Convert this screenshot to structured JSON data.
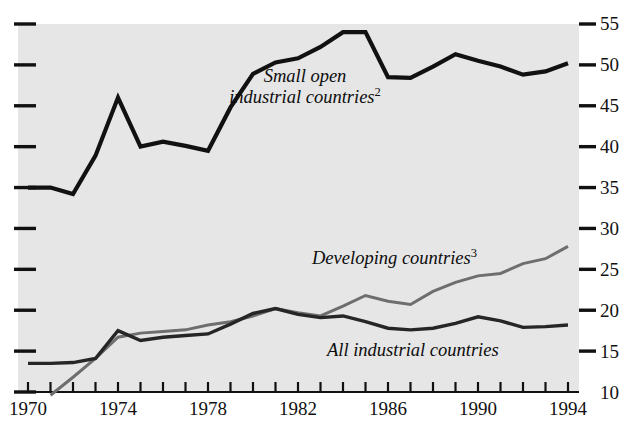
{
  "chart_data": {
    "type": "line",
    "title": "",
    "subtitle": "",
    "xlabel": "",
    "ylabel": "",
    "xlim": [
      1970,
      1994
    ],
    "ylim": [
      10,
      55
    ],
    "grid": false,
    "legend_position": "inline-annotations",
    "plot_background": "#e6e6e6",
    "x": [
      1970,
      1971,
      1972,
      1973,
      1974,
      1975,
      1976,
      1977,
      1978,
      1979,
      1980,
      1981,
      1982,
      1983,
      1984,
      1985,
      1986,
      1987,
      1988,
      1989,
      1990,
      1991,
      1992,
      1993,
      1994
    ],
    "xticks": [
      1970,
      1971,
      1972,
      1973,
      1974,
      1975,
      1976,
      1977,
      1978,
      1979,
      1980,
      1981,
      1982,
      1983,
      1984,
      1985,
      1986,
      1987,
      1988,
      1989,
      1990,
      1991,
      1992,
      1993,
      1994
    ],
    "xtick_labels": [
      "1970",
      "1974",
      "1978",
      "1982",
      "1986",
      "1990",
      "1994"
    ],
    "xtick_label_values": [
      1970,
      1974,
      1978,
      1982,
      1986,
      1990,
      1994
    ],
    "yticks": [
      10,
      15,
      20,
      25,
      30,
      35,
      40,
      45,
      50,
      55
    ],
    "ytick_labels": [
      "10",
      "15",
      "20",
      "25",
      "30",
      "35",
      "40",
      "45",
      "50",
      "55"
    ],
    "series": [
      {
        "name": "Small open industrial countries",
        "footnote": "2",
        "color": "#111111",
        "width": 4.2,
        "values": [
          35.0,
          35.0,
          34.2,
          38.9,
          46.0,
          40.0,
          40.6,
          40.1,
          39.5,
          44.8,
          48.9,
          50.3,
          50.8,
          52.2,
          54.0,
          54.0,
          48.5,
          48.4,
          49.8,
          51.3,
          50.5,
          49.8,
          48.8,
          49.2,
          50.2
        ]
      },
      {
        "name": "Developing countries",
        "footnote": "3",
        "color": "#6e6e6e",
        "width": 3.0,
        "values": [
          null,
          9.6,
          11.8,
          14.1,
          16.7,
          17.2,
          17.4,
          17.6,
          18.2,
          18.6,
          19.3,
          20.2,
          19.7,
          19.3,
          20.5,
          21.8,
          21.1,
          20.7,
          22.3,
          23.4,
          24.2,
          24.5,
          25.7,
          26.3,
          27.8
        ]
      },
      {
        "name": "All industrial countries",
        "footnote": "",
        "color": "#262626",
        "width": 3.4,
        "values": [
          13.5,
          13.5,
          13.6,
          14.1,
          17.5,
          16.3,
          16.7,
          16.9,
          17.1,
          18.3,
          19.6,
          20.2,
          19.5,
          19.1,
          19.3,
          18.6,
          17.8,
          17.6,
          17.8,
          18.4,
          19.2,
          18.7,
          17.9,
          18.0,
          18.2
        ]
      }
    ],
    "annotations": [
      {
        "name": "small-open-industrial-countries",
        "line1": "Small open",
        "line2": "industrial countries",
        "footnote": "2"
      },
      {
        "name": "developing-countries",
        "line1": "Developing countries",
        "line2": "",
        "footnote": "3"
      },
      {
        "name": "all-industrial-countries",
        "line1": "All industrial countries",
        "line2": "",
        "footnote": ""
      }
    ]
  },
  "axes": {
    "y_labels": [
      "55",
      "50",
      "45",
      "40",
      "35",
      "30",
      "25",
      "20",
      "15",
      "10"
    ],
    "x_labels": [
      "1970",
      "1974",
      "1978",
      "1982",
      "1986",
      "1990",
      "1994"
    ]
  }
}
